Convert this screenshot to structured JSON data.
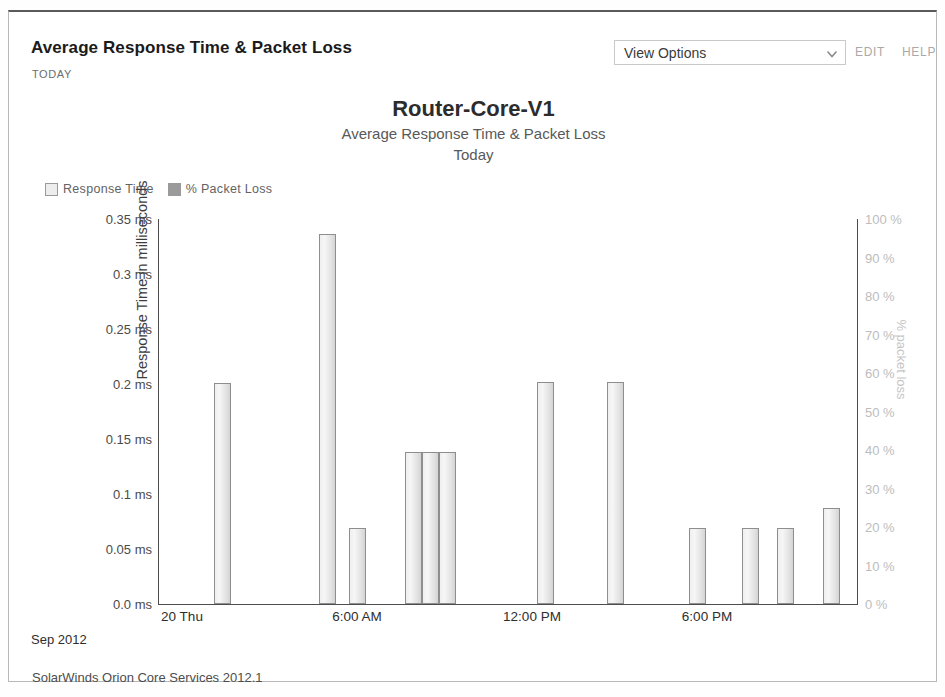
{
  "resource": {
    "title": "Average Response Time & Packet Loss",
    "subtitle": "TODAY",
    "view_options_label": "View Options",
    "chevron_icon": "chevron-down-icon",
    "edit_label": "EDIT",
    "help_label": "HELP"
  },
  "footer": {
    "text": "SolarWinds Orion Core Services 2012.1"
  },
  "chart_data": {
    "type": "bar",
    "title": "Router-Core-V1",
    "subtitle": "Average Response Time & Packet Loss",
    "subtitle2": "Today",
    "xlabel": "",
    "ylabel": "Response Time in milliseconds",
    "y2label": "% packet loss",
    "ylim": [
      0,
      0.35
    ],
    "y2lim": [
      0,
      100
    ],
    "grid": false,
    "legend_position": "top-left",
    "legend": [
      {
        "name": "Response Time",
        "color": "#ededed"
      },
      {
        "name": "% Packet Loss",
        "color": "#9b9b9b"
      }
    ],
    "yticks": [
      "0.0 ms",
      "0.05 ms",
      "0.1 ms",
      "0.15 ms",
      "0.2 ms",
      "0.25 ms",
      "0.3 ms",
      "0.35 ms"
    ],
    "ytick_values": [
      0,
      0.05,
      0.1,
      0.15,
      0.2,
      0.25,
      0.3,
      0.35
    ],
    "y2ticks": [
      "0 %",
      "10 %",
      "20 %",
      "30 %",
      "40 %",
      "50 %",
      "60 %",
      "70 %",
      "80 %",
      "90 %",
      "100 %"
    ],
    "y2tick_values": [
      0,
      10,
      20,
      30,
      40,
      50,
      60,
      70,
      80,
      90,
      100
    ],
    "xticks": [
      "20 Thu",
      "6:00 AM",
      "12:00 PM",
      "6:00 PM"
    ],
    "xtick_hours": [
      0,
      6,
      12,
      18
    ],
    "x_axis_date": "Sep 2012",
    "x_range_hours": [
      0,
      24
    ],
    "series": [
      {
        "name": "Response Time",
        "unit": "ms",
        "bars": [
          {
            "hour": 2.2,
            "value": 0.201
          },
          {
            "hour": 5.8,
            "value": 0.336
          },
          {
            "hour": 6.85,
            "value": 0.069
          },
          {
            "hour": 8.75,
            "value": 0.138
          },
          {
            "hour": 9.35,
            "value": 0.138
          },
          {
            "hour": 9.92,
            "value": 0.138
          },
          {
            "hour": 13.3,
            "value": 0.202
          },
          {
            "hour": 15.7,
            "value": 0.202
          },
          {
            "hour": 18.5,
            "value": 0.069
          },
          {
            "hour": 20.3,
            "value": 0.069
          },
          {
            "hour": 21.5,
            "value": 0.069
          },
          {
            "hour": 23.1,
            "value": 0.087
          }
        ]
      },
      {
        "name": "% Packet Loss",
        "unit": "%",
        "bars": []
      }
    ]
  }
}
